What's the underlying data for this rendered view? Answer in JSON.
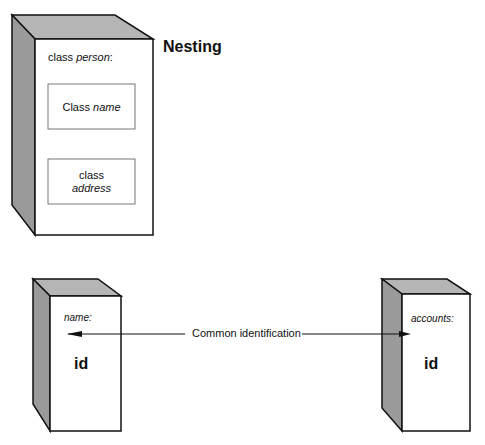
{
  "title": "Nesting",
  "nesting_box": {
    "label_prefix": "class ",
    "label_name": "person",
    "label_suffix": ":",
    "inner_boxes": [
      {
        "line1_prefix": "Class ",
        "line1_name": "name"
      },
      {
        "line1": "class",
        "line2_name": "address"
      }
    ]
  },
  "left_box": {
    "label": "name:",
    "field": "id"
  },
  "right_box": {
    "label": "accounts:",
    "field": "id"
  },
  "connector": {
    "label": "Common identification"
  },
  "colors": {
    "side_face": "#9a9a9a",
    "top_face": "#b5b5b5",
    "stroke": "#111111"
  }
}
